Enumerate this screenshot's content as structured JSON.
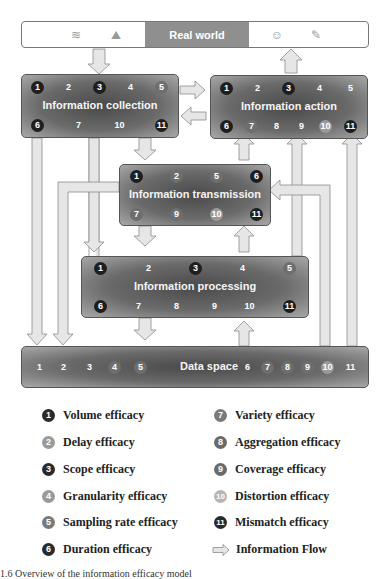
{
  "real_world": {
    "label": "Real world",
    "icons_left": [
      "waves-icon",
      "landscape-icon"
    ],
    "icons_right": [
      "head-brain-icon",
      "edit-document-icon"
    ]
  },
  "boxes": {
    "collection": {
      "title": "Information collection",
      "top_row": [
        {
          "n": "1",
          "style": "dark"
        },
        {
          "n": "2",
          "style": "plain"
        },
        {
          "n": "3",
          "style": "dark"
        },
        {
          "n": "4",
          "style": "plain"
        },
        {
          "n": "5",
          "style": "mid"
        }
      ],
      "bottom_row": [
        {
          "n": "6",
          "style": "dark"
        },
        {
          "n": "7",
          "style": "plain"
        },
        {
          "n": "10",
          "style": "plain"
        },
        {
          "n": "11",
          "style": "dark"
        }
      ]
    },
    "action": {
      "title": "Information action",
      "top_row": [
        {
          "n": "1",
          "style": "dark"
        },
        {
          "n": "2",
          "style": "plain"
        },
        {
          "n": "3",
          "style": "dark"
        },
        {
          "n": "4",
          "style": "plain"
        },
        {
          "n": "5",
          "style": "plain"
        }
      ],
      "bottom_row": [
        {
          "n": "6",
          "style": "dark"
        },
        {
          "n": "7",
          "style": "mid"
        },
        {
          "n": "8",
          "style": "plain"
        },
        {
          "n": "9",
          "style": "plain"
        },
        {
          "n": "10",
          "style": "light"
        },
        {
          "n": "11",
          "style": "dark"
        }
      ]
    },
    "transmission": {
      "title": "Information transmission",
      "top_row": [
        {
          "n": "1",
          "style": "dark"
        },
        {
          "n": "2",
          "style": "mid"
        },
        {
          "n": "5",
          "style": "mid"
        },
        {
          "n": "6",
          "style": "dark"
        }
      ],
      "bottom_row": [
        {
          "n": "7",
          "style": "mid"
        },
        {
          "n": "9",
          "style": "mid"
        },
        {
          "n": "10",
          "style": "light"
        },
        {
          "n": "11",
          "style": "dark"
        }
      ]
    },
    "processing": {
      "title": "Information processing",
      "top_row": [
        {
          "n": "1",
          "style": "dark"
        },
        {
          "n": "2",
          "style": "plain"
        },
        {
          "n": "3",
          "style": "dark"
        },
        {
          "n": "4",
          "style": "plain"
        },
        {
          "n": "5",
          "style": "mid"
        }
      ],
      "bottom_row": [
        {
          "n": "6",
          "style": "dark"
        },
        {
          "n": "7",
          "style": "plain"
        },
        {
          "n": "8",
          "style": "plain"
        },
        {
          "n": "9",
          "style": "plain"
        },
        {
          "n": "10",
          "style": "plain"
        },
        {
          "n": "11",
          "style": "dark"
        }
      ]
    },
    "data_space": {
      "title": "Data space",
      "left_nums": [
        {
          "n": "1",
          "style": "plain"
        },
        {
          "n": "2",
          "style": "mid"
        },
        {
          "n": "3",
          "style": "plain"
        },
        {
          "n": "4",
          "style": "mid"
        },
        {
          "n": "5",
          "style": "mid"
        }
      ],
      "right_nums": [
        {
          "n": "6",
          "style": "plain"
        },
        {
          "n": "7",
          "style": "mid"
        },
        {
          "n": "8",
          "style": "mid"
        },
        {
          "n": "9",
          "style": "mid"
        },
        {
          "n": "10",
          "style": "light"
        },
        {
          "n": "11",
          "style": "plain"
        }
      ]
    }
  },
  "legend": {
    "left": [
      {
        "n": "1",
        "label": "Volume efficacy",
        "color": "#2a2a2a"
      },
      {
        "n": "2",
        "label": "Delay efficacy",
        "color": "#9a9a9a"
      },
      {
        "n": "3",
        "label": "Scope efficacy",
        "color": "#2a2a2a"
      },
      {
        "n": "4",
        "label": "Granularity efficacy",
        "color": "#9a9a9a"
      },
      {
        "n": "5",
        "label": "Sampling rate efficacy",
        "color": "#7a7a7a"
      },
      {
        "n": "6",
        "label": "Duration efficacy",
        "color": "#2a2a2a"
      }
    ],
    "right": [
      {
        "n": "7",
        "label": "Variety efficacy",
        "color": "#7a7a7a"
      },
      {
        "n": "8",
        "label": "Aggregation efficacy",
        "color": "#6a6a6a"
      },
      {
        "n": "9",
        "label": "Coverage efficacy",
        "color": "#6a6a6a"
      },
      {
        "n": "10",
        "label": "Distortion efficacy",
        "color": "#b5b5b5"
      },
      {
        "n": "11",
        "label": "Mismatch efficacy",
        "color": "#2a2a2a"
      }
    ],
    "flow_label": "Information Flow"
  },
  "caption": "1.6  Overview of the information efficacy model"
}
